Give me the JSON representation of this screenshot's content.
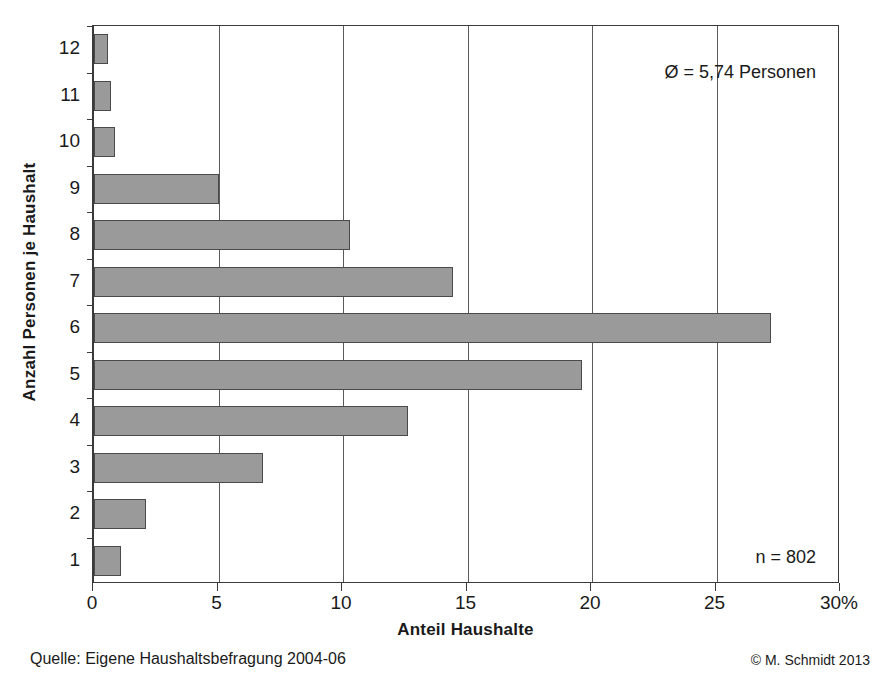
{
  "chart_data": {
    "type": "bar",
    "orientation": "horizontal",
    "title": "",
    "xlabel": "Anteil Haushalte",
    "ylabel": "Anzahl Personen je Haushalt",
    "categories": [
      "1",
      "2",
      "3",
      "4",
      "5",
      "6",
      "7",
      "8",
      "9",
      "10",
      "11",
      "12"
    ],
    "values": [
      1.1,
      2.1,
      6.8,
      12.6,
      19.6,
      27.2,
      14.4,
      10.3,
      5.0,
      0.85,
      0.7,
      0.55
    ],
    "series": [
      {
        "name": "Anteil Haushalte",
        "values": [
          1.1,
          2.1,
          6.8,
          12.6,
          19.6,
          27.2,
          14.4,
          10.3,
          5.0,
          0.85,
          0.7,
          0.55
        ]
      }
    ],
    "xlim": [
      0,
      30
    ],
    "xticks": [
      0,
      5,
      10,
      15,
      20,
      25,
      30
    ],
    "xtick_labels": [
      "0",
      "5",
      "10",
      "15",
      "20",
      "25",
      "30%"
    ],
    "grid": "vertical-only",
    "legend": "none",
    "bar_color": "#9a9a9a",
    "bar_border_color": "#4a4a4a",
    "axis_color": "#3a3a3a",
    "annotations": [
      {
        "id": "mean",
        "text": "Ø = 5,74 Personen"
      },
      {
        "id": "n",
        "text": "n = 802"
      }
    ]
  },
  "axes": {
    "y_title": "Anzahl Personen je Haushalt",
    "x_title": "Anteil Haushalte",
    "y_tick_labels": [
      "12",
      "11",
      "10",
      "9",
      "8",
      "7",
      "6",
      "5",
      "4",
      "3",
      "2",
      "1"
    ],
    "x_tick_labels": [
      "0",
      "5",
      "10",
      "15",
      "20",
      "25",
      "30%"
    ]
  },
  "annotations": {
    "mean": "Ø = 5,74 Personen",
    "sample_size": "n = 802"
  },
  "footer": {
    "source": "Quelle: Eigene Haushaltsbefragung 2004-06",
    "copyright": "© M. Schmidt 2013"
  }
}
